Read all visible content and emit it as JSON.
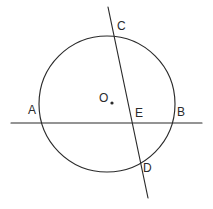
{
  "figure": {
    "background_color": "#ffffff",
    "stroke_color": "#2b2b2b",
    "label_color": "#2b2b2b"
  },
  "circle": {
    "name": "circle-O",
    "center_x": 107,
    "center_y": 104,
    "radius": 68
  },
  "center_point": {
    "label": "O",
    "label_x": 99,
    "label_y": 92,
    "dot_x": 112,
    "dot_y": 103,
    "dot_radius": 1.6
  },
  "lines": [
    {
      "name": "secant-line-AB",
      "label": "AB",
      "x1": 11,
      "y1": 123,
      "x2": 202,
      "y2": 123
    },
    {
      "name": "chord-line-CD",
      "label": "CD",
      "x1": 108,
      "y1": 7,
      "x2": 148,
      "y2": 198
    }
  ],
  "points": [
    {
      "label": "A",
      "name": "point-A",
      "px": 42,
      "py": 123,
      "label_x": 28,
      "label_y": 104
    },
    {
      "label": "B",
      "name": "point-B",
      "px": 173,
      "py": 123,
      "label_x": 177,
      "label_y": 106
    },
    {
      "label": "C",
      "name": "point-C",
      "px": 114,
      "py": 35,
      "label_x": 117,
      "label_y": 20
    },
    {
      "label": "D",
      "name": "point-D",
      "px": 140,
      "py": 163,
      "label_x": 143,
      "label_y": 162
    },
    {
      "label": "E",
      "name": "point-E",
      "px": 132,
      "py": 123,
      "label_x": 135,
      "label_y": 107
    }
  ]
}
